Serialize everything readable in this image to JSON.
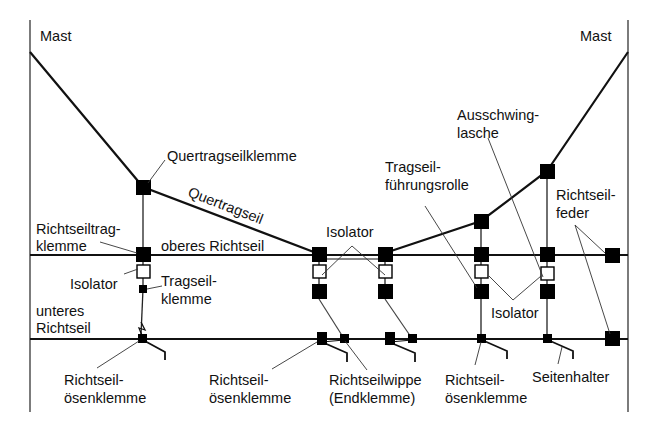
{
  "diagram": {
    "labels": {
      "mast_left": "Mast",
      "mast_right": "Mast",
      "quertragseilklemme": "Quertragseilklemme",
      "quertragseil": "Quertragseil",
      "richtseiltragklemme_1": "Richtseiltrag-",
      "richtseiltragklemme_2": "klemme",
      "oberes_richtseil": "oberes Richtseil",
      "isolator_left": "Isolator",
      "tragseilklemme_1": "Tragseil-",
      "tragseilklemme_2": "klemme",
      "unteres_richtseil_1": "unteres",
      "unteres_richtseil_2": "Richtseil",
      "isolator_center": "Isolator",
      "tragseilfuehrungsrolle_1": "Tragseil-",
      "tragseilfuehrungsrolle_2": "führungsrolle",
      "ausschwinglasche_1": "Ausschwing-",
      "ausschwinglasche_2": "lasche",
      "richtseilfeder_1": "Richtseil-",
      "richtseilfeder_2": "feder",
      "isolator_right": "Isolator",
      "oesenklemme_a_1": "Richtseil-",
      "oesenklemme_a_2": "ösenklemme",
      "oesenklemme_b_1": "Richtseil-",
      "oesenklemme_b_2": "ösenklemme",
      "richtseilwippe_1": "Richtseilwippe",
      "richtseilwippe_2": "(Endklemme)",
      "oesenklemme_c_1": "Richtseil-",
      "oesenklemme_c_2": "ösenklemme",
      "seitenhalter": "Seitenhalter"
    },
    "colors": {
      "background": "#ffffff",
      "line": "#111111",
      "leader": "#333333"
    }
  }
}
